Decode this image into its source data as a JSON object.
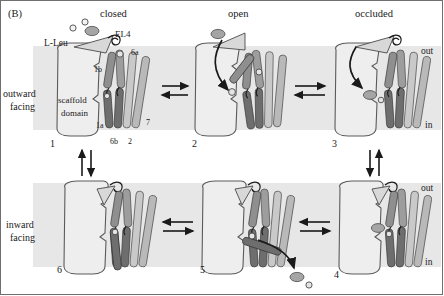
{
  "figure": {
    "panel_label": "(B)",
    "type": "transport-cycle-diagram",
    "colors": {
      "membrane_band": "#e6e6e6",
      "scaffold_fill": "#eceaea",
      "scaffold_stroke": "#5a5a5a",
      "helix_dark": "#6e6e6e",
      "helix_mid": "#9a9a9a",
      "helix_light": "#c9c9c9",
      "substrate": "#9e9e9e",
      "arrow": "#1a1a1a",
      "text": "#1a1a1a",
      "border": "#6f6f6f"
    }
  },
  "column_headers": [
    {
      "label": "closed",
      "x": 117
    },
    {
      "label": "open",
      "x": 240
    },
    {
      "label": "occluded",
      "x": 375
    }
  ],
  "row_labels": [
    {
      "line1": "outward",
      "line2": "facing"
    },
    {
      "line1": "inward",
      "line2": "facing"
    }
  ],
  "membrane_sides": {
    "out": "out",
    "in": "in"
  },
  "substrate": {
    "name": "L-Leu",
    "ion_count": 2
  },
  "annotations": {
    "el4": "EL4",
    "scaffold_line1": "scaffold",
    "scaffold_line2": "domain",
    "helices": [
      "1b",
      "6a",
      "1a",
      "6b",
      "2",
      "7"
    ]
  },
  "states": [
    {
      "number": "1",
      "x": 50,
      "y": 143,
      "conformation": "closed",
      "orientation": "outward facing"
    },
    {
      "number": "2",
      "x": 192,
      "y": 143,
      "conformation": "open",
      "orientation": "outward facing"
    },
    {
      "number": "3",
      "x": 332,
      "y": 143,
      "conformation": "occluded",
      "orientation": "outward facing"
    },
    {
      "number": "4",
      "x": 334,
      "y": 274,
      "conformation": "occluded",
      "orientation": "inward facing"
    },
    {
      "number": "5",
      "x": 200,
      "y": 270,
      "conformation": "open",
      "orientation": "inward facing"
    },
    {
      "number": "6",
      "x": 57,
      "y": 270,
      "conformation": "closed",
      "orientation": "inward facing"
    }
  ],
  "transitions": [
    {
      "from": "1",
      "to": "2",
      "kind": "horizontal-equilibrium"
    },
    {
      "from": "2",
      "to": "3",
      "kind": "horizontal-equilibrium"
    },
    {
      "from": "3",
      "to": "4",
      "kind": "vertical-equilibrium"
    },
    {
      "from": "4",
      "to": "5",
      "kind": "horizontal-equilibrium"
    },
    {
      "from": "5",
      "to": "6",
      "kind": "horizontal-equilibrium"
    },
    {
      "from": "6",
      "to": "1",
      "kind": "vertical-equilibrium"
    }
  ]
}
